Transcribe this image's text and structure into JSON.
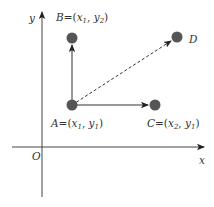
{
  "diagram": {
    "title": "",
    "colors": {
      "axis": "#444444",
      "arrow": "#333333",
      "point": "#555555",
      "text": "#333333",
      "background": "#ffffff"
    },
    "axes": {
      "x_label": "x",
      "y_label": "y",
      "origin_label": "O"
    },
    "points": [
      {
        "id": "A",
        "name": "A",
        "eq": "=(",
        "v1": "x",
        "s1": "1",
        "sep": ", ",
        "v2": "y",
        "s2": "1",
        "close": ")"
      },
      {
        "id": "B",
        "name": "B",
        "eq": "=(",
        "v1": "x",
        "s1": "1",
        "sep": ", ",
        "v2": "y",
        "s2": "2",
        "close": ")"
      },
      {
        "id": "C",
        "name": "C",
        "eq": "=(",
        "v1": "x",
        "s1": "2",
        "sep": ", ",
        "v2": "y",
        "s2": "1",
        "close": ")"
      },
      {
        "id": "D",
        "name": "D"
      }
    ],
    "edges": [
      {
        "from": "A",
        "to": "B",
        "style": "solid"
      },
      {
        "from": "A",
        "to": "C",
        "style": "solid"
      },
      {
        "from": "A",
        "to": "D",
        "style": "dashed"
      }
    ]
  }
}
